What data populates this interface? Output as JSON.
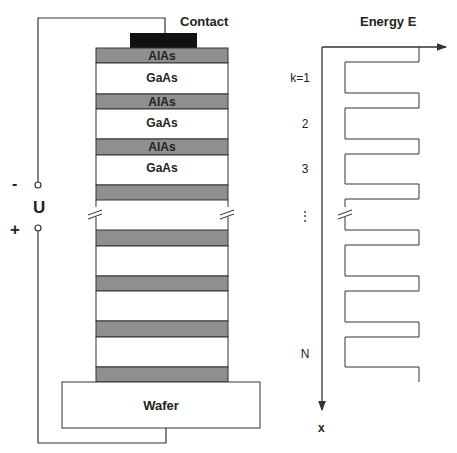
{
  "colors": {
    "line": "#333333",
    "barrier": "#8f8f8f",
    "well": "#ffffff",
    "contact": "#111111",
    "text": "#222222"
  },
  "structure": {
    "contact_label": "Contact",
    "wafer_label": "Wafer",
    "voltage_label": "U",
    "minus_label": "-",
    "plus_label": "+",
    "layers_top": [
      {
        "material": "AlAs",
        "type": "barrier",
        "label": "AlAs"
      },
      {
        "material": "GaAs",
        "type": "well",
        "label": "GaAs"
      },
      {
        "material": "AlAs",
        "type": "barrier",
        "label": "AlAs"
      },
      {
        "material": "GaAs",
        "type": "well",
        "label": "GaAs"
      },
      {
        "material": "AlAs",
        "type": "barrier",
        "label": "AlAs"
      },
      {
        "material": "GaAs",
        "type": "well",
        "label": "GaAs"
      },
      {
        "material": "AlAs",
        "type": "barrier",
        "label": ""
      }
    ],
    "layers_bottom": [
      {
        "type": "barrier"
      },
      {
        "type": "well"
      },
      {
        "type": "barrier"
      },
      {
        "type": "well"
      },
      {
        "type": "barrier"
      },
      {
        "type": "well"
      },
      {
        "type": "barrier"
      }
    ]
  },
  "energy_diagram": {
    "title": "Energy E",
    "x_axis_label": "x",
    "well_labels": [
      "k=1",
      "2",
      "3",
      "⋮",
      "N"
    ]
  }
}
